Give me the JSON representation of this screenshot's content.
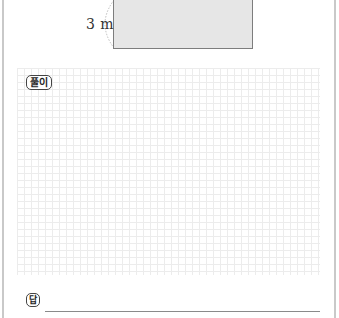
{
  "figure": {
    "dimension_label": "3 m",
    "shape": "rectangle",
    "fill_color": "#e6e6e6",
    "border_color": "#7d7d7d"
  },
  "solution": {
    "badge_label": "풀이",
    "grid_color": "#ececec"
  },
  "answer": {
    "badge_label": "답",
    "value": ""
  }
}
